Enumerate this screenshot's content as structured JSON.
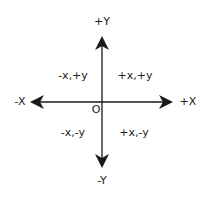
{
  "diagram": {
    "colors": {
      "axis": "#1a1a1a",
      "text": "#222222",
      "background": "#ffffff"
    },
    "axes": {
      "positive_y": "+Y",
      "negative_y": "-Y",
      "positive_x": "+X",
      "negative_x": "-X"
    },
    "origin": "O",
    "quadrants": [
      {
        "id": "q2",
        "label": "-x,+y"
      },
      {
        "id": "q1",
        "label": "+x,+y"
      },
      {
        "id": "q3",
        "label": "-x,-y"
      },
      {
        "id": "q4",
        "label": "+x,-y"
      }
    ]
  }
}
